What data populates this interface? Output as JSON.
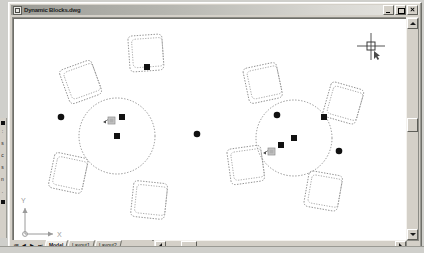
{
  "window": {
    "title": "Dynamic Blocks.dwg",
    "icon": "dwg-document-icon",
    "controls": [
      {
        "name": "minimize",
        "label": "Minimize"
      },
      {
        "name": "maximize",
        "label": "Maximize"
      },
      {
        "name": "close",
        "label": "Close"
      }
    ]
  },
  "left_toolbar": {
    "name": "draw-toolbar",
    "items": [
      {
        "label": "■",
        "name": "rectangle-tool"
      },
      {
        "label": "∴",
        "name": "point-tool"
      },
      {
        "label": "≡",
        "name": "hatch-tool"
      },
      {
        "label": "◔",
        "name": "gradient-tool"
      },
      {
        "label": "▤",
        "name": "region-tool"
      },
      {
        "label": "▬",
        "name": "table-tool"
      },
      {
        "label": "▪",
        "name": "block-tool"
      }
    ]
  },
  "canvas": {
    "name": "drawing-area",
    "background": "#ffffff",
    "geometry_color": "#7e7e7e",
    "grip_color": "#111111",
    "cursor": {
      "name": "crosshair-cursor",
      "x": 368,
      "y": 35,
      "label": "R"
    },
    "ucs_icon": {
      "x_label": "X",
      "y_label": "Y"
    },
    "blocks": [
      {
        "name": "round-table-left",
        "cx": 112,
        "cy": 125,
        "r": 38,
        "chairs": [
          {
            "cx": 140,
            "cy": 43,
            "rot": -4
          },
          {
            "cx": 75,
            "cy": 72,
            "rot": -18
          },
          {
            "cx": 62,
            "cy": 163,
            "rot": 12
          },
          {
            "cx": 143,
            "cy": 190,
            "rot": 6
          }
        ],
        "square_grips": [
          [
            112,
            125
          ],
          [
            116,
            107
          ],
          [
            141,
            56
          ]
        ],
        "round_grips": [
          [
            55,
            106
          ],
          [
            192,
            123
          ]
        ],
        "action_grips": [
          [
            106,
            112
          ]
        ]
      },
      {
        "name": "round-table-right",
        "cx": 288,
        "cy": 126,
        "r": 38,
        "chairs": [
          {
            "cx": 258,
            "cy": 73,
            "rot": -10
          },
          {
            "cx": 337,
            "cy": 93,
            "rot": 14
          },
          {
            "cx": 240,
            "cy": 155,
            "rot": -8
          },
          {
            "cx": 317,
            "cy": 181,
            "rot": 10
          }
        ],
        "square_grips": [
          [
            288,
            126
          ],
          [
            275,
            134
          ],
          [
            325,
            105
          ]
        ],
        "round_grips": [
          [
            275,
            104
          ],
          [
            341,
            140
          ]
        ],
        "action_grips": [
          [
            268,
            140
          ]
        ]
      }
    ]
  },
  "scrollbars": {
    "vertical": {
      "name": "vertical-scrollbar",
      "thumb_top": 0.46
    },
    "horizontal": {
      "name": "horizontal-scrollbar",
      "thumb_left": 0.1
    }
  },
  "tabs": {
    "nav": [
      {
        "name": "first-tab-button",
        "glyph": "⏮"
      },
      {
        "name": "previous-tab-button",
        "glyph": "◀"
      },
      {
        "name": "next-tab-button",
        "glyph": "▶"
      },
      {
        "name": "last-tab-button",
        "glyph": "⏭"
      }
    ],
    "items": [
      {
        "label": "Model",
        "active": true
      },
      {
        "label": "Layout1",
        "active": false
      },
      {
        "label": "Layout2",
        "active": false
      }
    ]
  }
}
